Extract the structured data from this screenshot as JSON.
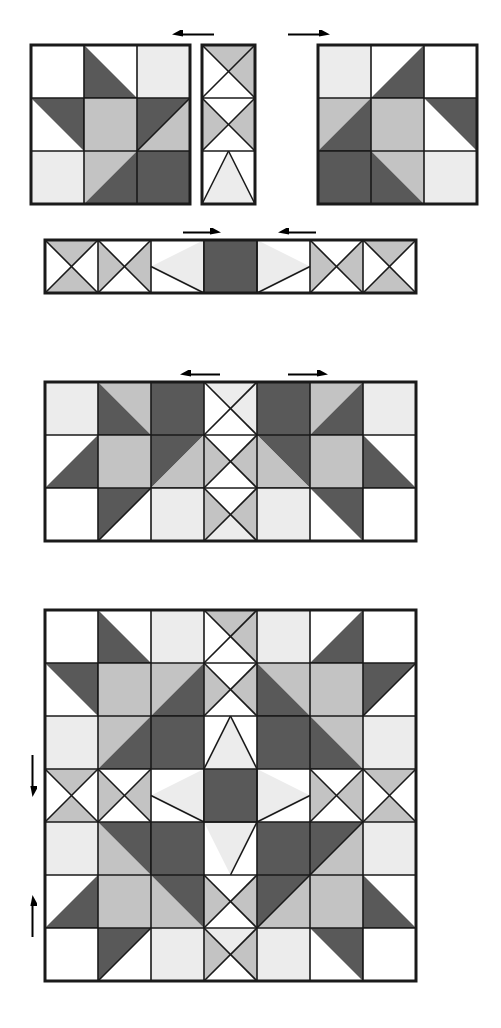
{
  "document": {
    "title": "Quilt Block Assembly Diagram",
    "width": 501,
    "height": 1028,
    "background": "#ffffff"
  },
  "palette": {
    "white": "#ffffff",
    "light": "#ececec",
    "medium": "#c3c3c3",
    "dark": "#595959",
    "outline": "#1a1a1a",
    "arrow": "#000000"
  },
  "geometry": {
    "cell": 53,
    "inner_stroke": 1.6,
    "outer_stroke": 3.0
  },
  "legend_note": "Patch codes: S=solid fill, HST-<corner>=half-square triangle with named corner filled, QST=quarter-square (hourglass/X) with four triangle fills N/E/S/W, FLY-<dir>=flying-geese style triangle pointing in direction",
  "figures": [
    {
      "name": "block-left",
      "label": "Star Block (left)",
      "x": 31,
      "y": 45,
      "cols": 3,
      "rows": 3,
      "patches": [
        {
          "r": 0,
          "c": 0,
          "type": "S",
          "fills": [
            "white"
          ]
        },
        {
          "r": 0,
          "c": 1,
          "type": "HST",
          "corner": "SW",
          "fills": [
            "dark",
            "white"
          ]
        },
        {
          "r": 0,
          "c": 2,
          "type": "S",
          "fills": [
            "light"
          ]
        },
        {
          "r": 1,
          "c": 0,
          "type": "HST",
          "corner": "NE",
          "fills": [
            "dark",
            "white"
          ]
        },
        {
          "r": 1,
          "c": 1,
          "type": "S",
          "fills": [
            "medium"
          ]
        },
        {
          "r": 1,
          "c": 2,
          "type": "HST",
          "corner": "NW",
          "fills": [
            "dark",
            "medium"
          ]
        },
        {
          "r": 2,
          "c": 0,
          "type": "S",
          "fills": [
            "light"
          ]
        },
        {
          "r": 2,
          "c": 1,
          "type": "HST",
          "corner": "SE",
          "fills": [
            "dark",
            "medium"
          ]
        },
        {
          "r": 2,
          "c": 2,
          "type": "S",
          "fills": [
            "dark"
          ]
        }
      ]
    },
    {
      "name": "block-center",
      "label": "Hourglass Sashing Block (center)",
      "x": 202,
      "y": 45,
      "cols": 1,
      "rows": 3,
      "patches": [
        {
          "r": 0,
          "c": 0,
          "type": "QST",
          "fills": [
            "medium",
            "medium",
            "white",
            "white"
          ]
        },
        {
          "r": 1,
          "c": 0,
          "type": "QST",
          "fills": [
            "white",
            "medium",
            "white",
            "medium"
          ]
        },
        {
          "r": 2,
          "c": 0,
          "type": "FLY",
          "dir": "N",
          "fills": [
            "light",
            "white"
          ]
        }
      ]
    },
    {
      "name": "block-right",
      "label": "Star Block (right, mirrored)",
      "x": 318,
      "y": 45,
      "cols": 3,
      "rows": 3,
      "patches": [
        {
          "r": 0,
          "c": 0,
          "type": "S",
          "fills": [
            "light"
          ]
        },
        {
          "r": 0,
          "c": 1,
          "type": "HST",
          "corner": "SE",
          "fills": [
            "dark",
            "white"
          ]
        },
        {
          "r": 0,
          "c": 2,
          "type": "S",
          "fills": [
            "white"
          ]
        },
        {
          "r": 1,
          "c": 0,
          "type": "HST",
          "corner": "SE",
          "fills": [
            "dark",
            "medium"
          ]
        },
        {
          "r": 1,
          "c": 1,
          "type": "S",
          "fills": [
            "medium"
          ]
        },
        {
          "r": 1,
          "c": 2,
          "type": "HST",
          "corner": "NE",
          "fills": [
            "dark",
            "white"
          ]
        },
        {
          "r": 2,
          "c": 0,
          "type": "S",
          "fills": [
            "dark"
          ]
        },
        {
          "r": 2,
          "c": 1,
          "type": "HST",
          "corner": "SW",
          "fills": [
            "dark",
            "medium"
          ]
        },
        {
          "r": 2,
          "c": 2,
          "type": "S",
          "fills": [
            "light"
          ]
        }
      ]
    },
    {
      "name": "strip-center-row",
      "label": "Center Row Strip",
      "x": 45,
      "y": 240,
      "cols": 7,
      "rows": 1,
      "patches": [
        {
          "r": 0,
          "c": 0,
          "type": "QST",
          "fills": [
            "medium",
            "white",
            "medium",
            "white"
          ]
        },
        {
          "r": 0,
          "c": 1,
          "type": "QST",
          "fills": [
            "white",
            "medium",
            "white",
            "medium"
          ]
        },
        {
          "r": 0,
          "c": 2,
          "type": "FLY",
          "dir": "W",
          "fills": [
            "light",
            "white"
          ]
        },
        {
          "r": 0,
          "c": 3,
          "type": "S",
          "fills": [
            "dark"
          ]
        },
        {
          "r": 0,
          "c": 4,
          "type": "FLY",
          "dir": "E",
          "fills": [
            "light",
            "white"
          ]
        },
        {
          "r": 0,
          "c": 5,
          "type": "QST",
          "fills": [
            "white",
            "medium",
            "white",
            "medium"
          ]
        },
        {
          "r": 0,
          "c": 6,
          "type": "QST",
          "fills": [
            "medium",
            "white",
            "medium",
            "white"
          ]
        }
      ]
    },
    {
      "name": "strip-top-row",
      "label": "Top Row Strip (three blocks joined)",
      "x": 45,
      "y": 382,
      "cols": 7,
      "rows": 3,
      "patches": [
        {
          "r": 0,
          "c": 0,
          "type": "S",
          "fills": [
            "light"
          ]
        },
        {
          "r": 0,
          "c": 1,
          "type": "HST",
          "corner": "SW",
          "fills": [
            "dark",
            "medium"
          ]
        },
        {
          "r": 0,
          "c": 2,
          "type": "S",
          "fills": [
            "dark"
          ]
        },
        {
          "r": 0,
          "c": 3,
          "type": "QST",
          "fills": [
            "light",
            "light",
            "white",
            "white"
          ]
        },
        {
          "r": 0,
          "c": 4,
          "type": "S",
          "fills": [
            "dark"
          ]
        },
        {
          "r": 0,
          "c": 5,
          "type": "HST",
          "corner": "SE",
          "fills": [
            "dark",
            "medium"
          ]
        },
        {
          "r": 0,
          "c": 6,
          "type": "S",
          "fills": [
            "light"
          ]
        },
        {
          "r": 1,
          "c": 0,
          "type": "HST",
          "corner": "SE",
          "fills": [
            "dark",
            "white"
          ]
        },
        {
          "r": 1,
          "c": 1,
          "type": "S",
          "fills": [
            "medium"
          ]
        },
        {
          "r": 1,
          "c": 2,
          "type": "HST",
          "corner": "SE",
          "fills": [
            "medium",
            "dark"
          ]
        },
        {
          "r": 1,
          "c": 3,
          "type": "QST",
          "fills": [
            "white",
            "medium",
            "white",
            "medium"
          ]
        },
        {
          "r": 1,
          "c": 4,
          "type": "HST",
          "corner": "SW",
          "fills": [
            "medium",
            "dark"
          ]
        },
        {
          "r": 1,
          "c": 5,
          "type": "S",
          "fills": [
            "medium"
          ]
        },
        {
          "r": 1,
          "c": 6,
          "type": "HST",
          "corner": "SW",
          "fills": [
            "dark",
            "white"
          ]
        },
        {
          "r": 2,
          "c": 0,
          "type": "S",
          "fills": [
            "white"
          ]
        },
        {
          "r": 2,
          "c": 1,
          "type": "HST",
          "corner": "NW",
          "fills": [
            "dark",
            "white"
          ]
        },
        {
          "r": 2,
          "c": 2,
          "type": "S",
          "fills": [
            "light"
          ]
        },
        {
          "r": 2,
          "c": 3,
          "type": "QST",
          "fills": [
            "white",
            "medium",
            "light",
            "medium"
          ]
        },
        {
          "r": 2,
          "c": 4,
          "type": "S",
          "fills": [
            "light"
          ]
        },
        {
          "r": 2,
          "c": 5,
          "type": "HST",
          "corner": "NE",
          "fills": [
            "dark",
            "white"
          ]
        },
        {
          "r": 2,
          "c": 6,
          "type": "S",
          "fills": [
            "white"
          ]
        }
      ]
    },
    {
      "name": "quilt-full",
      "label": "Completed Quilt Layout",
      "x": 45,
      "y": 610,
      "cols": 7,
      "rows": 7,
      "patches": [
        {
          "r": 0,
          "c": 0,
          "type": "S",
          "fills": [
            "white"
          ]
        },
        {
          "r": 0,
          "c": 1,
          "type": "HST",
          "corner": "SW",
          "fills": [
            "dark",
            "white"
          ]
        },
        {
          "r": 0,
          "c": 2,
          "type": "S",
          "fills": [
            "light"
          ]
        },
        {
          "r": 0,
          "c": 3,
          "type": "QST",
          "fills": [
            "medium",
            "medium",
            "white",
            "white"
          ]
        },
        {
          "r": 0,
          "c": 4,
          "type": "S",
          "fills": [
            "light"
          ]
        },
        {
          "r": 0,
          "c": 5,
          "type": "HST",
          "corner": "SE",
          "fills": [
            "dark",
            "white"
          ]
        },
        {
          "r": 0,
          "c": 6,
          "type": "S",
          "fills": [
            "white"
          ]
        },
        {
          "r": 1,
          "c": 0,
          "type": "HST",
          "corner": "NE",
          "fills": [
            "dark",
            "white"
          ]
        },
        {
          "r": 1,
          "c": 1,
          "type": "S",
          "fills": [
            "medium"
          ]
        },
        {
          "r": 1,
          "c": 2,
          "type": "HST",
          "corner": "SE",
          "fills": [
            "dark",
            "medium"
          ]
        },
        {
          "r": 1,
          "c": 3,
          "type": "QST",
          "fills": [
            "white",
            "medium",
            "white",
            "medium"
          ]
        },
        {
          "r": 1,
          "c": 4,
          "type": "HST",
          "corner": "SW",
          "fills": [
            "dark",
            "medium"
          ]
        },
        {
          "r": 1,
          "c": 5,
          "type": "S",
          "fills": [
            "medium"
          ]
        },
        {
          "r": 1,
          "c": 6,
          "type": "HST",
          "corner": "NW",
          "fills": [
            "dark",
            "white"
          ]
        },
        {
          "r": 2,
          "c": 0,
          "type": "S",
          "fills": [
            "light"
          ]
        },
        {
          "r": 2,
          "c": 1,
          "type": "HST",
          "corner": "SE",
          "fills": [
            "dark",
            "medium"
          ]
        },
        {
          "r": 2,
          "c": 2,
          "type": "S",
          "fills": [
            "dark"
          ]
        },
        {
          "r": 2,
          "c": 3,
          "type": "FLY",
          "dir": "N",
          "fills": [
            "light",
            "white"
          ]
        },
        {
          "r": 2,
          "c": 4,
          "type": "S",
          "fills": [
            "dark"
          ]
        },
        {
          "r": 2,
          "c": 5,
          "type": "HST",
          "corner": "SW",
          "fills": [
            "dark",
            "medium"
          ]
        },
        {
          "r": 2,
          "c": 6,
          "type": "S",
          "fills": [
            "light"
          ]
        },
        {
          "r": 3,
          "c": 0,
          "type": "QST",
          "fills": [
            "medium",
            "white",
            "medium",
            "white"
          ]
        },
        {
          "r": 3,
          "c": 1,
          "type": "QST",
          "fills": [
            "white",
            "medium",
            "white",
            "medium"
          ]
        },
        {
          "r": 3,
          "c": 2,
          "type": "FLY",
          "dir": "W",
          "fills": [
            "light",
            "white"
          ]
        },
        {
          "r": 3,
          "c": 3,
          "type": "S",
          "fills": [
            "dark"
          ]
        },
        {
          "r": 3,
          "c": 4,
          "type": "FLY",
          "dir": "E",
          "fills": [
            "light",
            "white"
          ]
        },
        {
          "r": 3,
          "c": 5,
          "type": "QST",
          "fills": [
            "white",
            "medium",
            "white",
            "medium"
          ]
        },
        {
          "r": 3,
          "c": 6,
          "type": "QST",
          "fills": [
            "medium",
            "white",
            "medium",
            "white"
          ]
        },
        {
          "r": 4,
          "c": 0,
          "type": "S",
          "fills": [
            "light"
          ]
        },
        {
          "r": 4,
          "c": 1,
          "type": "HST",
          "corner": "NE",
          "fills": [
            "dark",
            "medium"
          ]
        },
        {
          "r": 4,
          "c": 2,
          "type": "S",
          "fills": [
            "dark"
          ]
        },
        {
          "r": 4,
          "c": 3,
          "type": "FLY",
          "dir": "S",
          "fills": [
            "light",
            "white"
          ]
        },
        {
          "r": 4,
          "c": 4,
          "type": "S",
          "fills": [
            "dark"
          ]
        },
        {
          "r": 4,
          "c": 5,
          "type": "HST",
          "corner": "NW",
          "fills": [
            "dark",
            "medium"
          ]
        },
        {
          "r": 4,
          "c": 6,
          "type": "S",
          "fills": [
            "light"
          ]
        },
        {
          "r": 5,
          "c": 0,
          "type": "HST",
          "corner": "SE",
          "fills": [
            "dark",
            "white"
          ]
        },
        {
          "r": 5,
          "c": 1,
          "type": "S",
          "fills": [
            "medium"
          ]
        },
        {
          "r": 5,
          "c": 2,
          "type": "HST",
          "corner": "NE",
          "fills": [
            "dark",
            "medium"
          ]
        },
        {
          "r": 5,
          "c": 3,
          "type": "QST",
          "fills": [
            "white",
            "medium",
            "white",
            "medium"
          ]
        },
        {
          "r": 5,
          "c": 4,
          "type": "HST",
          "corner": "NW",
          "fills": [
            "dark",
            "medium"
          ]
        },
        {
          "r": 5,
          "c": 5,
          "type": "S",
          "fills": [
            "medium"
          ]
        },
        {
          "r": 5,
          "c": 6,
          "type": "HST",
          "corner": "SW",
          "fills": [
            "dark",
            "white"
          ]
        },
        {
          "r": 6,
          "c": 0,
          "type": "S",
          "fills": [
            "white"
          ]
        },
        {
          "r": 6,
          "c": 1,
          "type": "HST",
          "corner": "NW",
          "fills": [
            "dark",
            "white"
          ]
        },
        {
          "r": 6,
          "c": 2,
          "type": "S",
          "fills": [
            "light"
          ]
        },
        {
          "r": 6,
          "c": 3,
          "type": "QST",
          "fills": [
            "light",
            "medium",
            "white",
            "medium"
          ]
        },
        {
          "r": 6,
          "c": 4,
          "type": "S",
          "fills": [
            "light"
          ]
        },
        {
          "r": 6,
          "c": 5,
          "type": "HST",
          "corner": "NE",
          "fills": [
            "dark",
            "white"
          ]
        },
        {
          "r": 6,
          "c": 6,
          "type": "S",
          "fills": [
            "white"
          ]
        }
      ]
    }
  ],
  "arrows": [
    {
      "name": "arrow-join-row1-left",
      "x": 172,
      "y": 30,
      "dir": "left",
      "length": 42
    },
    {
      "name": "arrow-join-row1-right",
      "x": 288,
      "y": 30,
      "dir": "right",
      "length": 42
    },
    {
      "name": "arrow-join-row2-left",
      "x": 183,
      "y": 228,
      "dir": "right",
      "length": 38
    },
    {
      "name": "arrow-join-row2-right",
      "x": 278,
      "y": 228,
      "dir": "left",
      "length": 38
    },
    {
      "name": "arrow-join-row3-left",
      "x": 180,
      "y": 370,
      "dir": "left",
      "length": 40
    },
    {
      "name": "arrow-join-row3-right",
      "x": 288,
      "y": 370,
      "dir": "right",
      "length": 40
    },
    {
      "name": "arrow-join-quilt-down",
      "x": 28,
      "y": 755,
      "dir": "down",
      "length": 42
    },
    {
      "name": "arrow-join-quilt-up",
      "x": 28,
      "y": 895,
      "dir": "up",
      "length": 42
    }
  ]
}
